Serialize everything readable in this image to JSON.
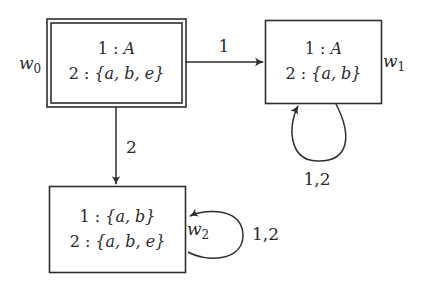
{
  "diagram": {
    "type": "kripke-model",
    "worlds": [
      {
        "id": "w0",
        "name_base": "w",
        "name_sub": "0",
        "designated": true,
        "lines": [
          {
            "agent": "1",
            "sep": " : ",
            "value": "A"
          },
          {
            "agent": "2",
            "sep": " : ",
            "value": "{a, b, e}"
          }
        ]
      },
      {
        "id": "w1",
        "name_base": "w",
        "name_sub": "1",
        "designated": false,
        "lines": [
          {
            "agent": "1",
            "sep": " : ",
            "value": "A"
          },
          {
            "agent": "2",
            "sep": " : ",
            "value": "{a, b}"
          }
        ]
      },
      {
        "id": "w2",
        "name_base": "w",
        "name_sub": "2",
        "designated": false,
        "lines": [
          {
            "agent": "1",
            "sep": " : ",
            "value": "{a, b}"
          },
          {
            "agent": "2",
            "sep": " : ",
            "value": "{a, b, e}"
          }
        ]
      }
    ],
    "edges": [
      {
        "from": "w0",
        "to": "w1",
        "label": "1"
      },
      {
        "from": "w0",
        "to": "w2",
        "label": "2"
      },
      {
        "from": "w1",
        "to": "w1",
        "label": "1,2"
      },
      {
        "from": "w2",
        "to": "w2",
        "label": "1,2"
      }
    ],
    "colors": {
      "stroke": "#2e2e2e",
      "text": "#2a2a2a",
      "background": "#ffffff"
    }
  }
}
